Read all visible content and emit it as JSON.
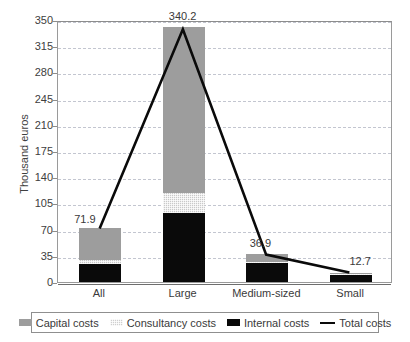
{
  "chart_data": {
    "type": "bar",
    "title": "",
    "subtitle": "",
    "xlabel": "",
    "ylabel": "Thousand euros",
    "ylim": [
      0,
      350
    ],
    "yticks": [
      0,
      35,
      70,
      105,
      140,
      175,
      210,
      245,
      280,
      315,
      350
    ],
    "grid": true,
    "legend_position": "bottom",
    "stacked": true,
    "categories": [
      "All",
      "Large",
      "Medium-sized",
      "Small"
    ],
    "series": [
      {
        "name": "Internal costs",
        "type": "bar",
        "color": "#0a0a0a",
        "values": [
          24.5,
          92.0,
          26.0,
          9.5
        ]
      },
      {
        "name": "Consultancy costs",
        "type": "bar",
        "color": "#c9c9c9",
        "values": [
          5.4,
          27.0,
          1.4,
          1.0
        ]
      },
      {
        "name": "Capital costs",
        "type": "bar",
        "color": "#9d9d9d",
        "values": [
          42.0,
          221.2,
          9.5,
          2.2
        ]
      },
      {
        "name": "Total costs",
        "type": "line",
        "color": "#0a0a0a",
        "values": [
          71.9,
          340.2,
          36.9,
          12.7
        ]
      }
    ],
    "data_labels": [
      "71.9",
      "340.2",
      "36.9",
      "12.7"
    ]
  },
  "axis": {
    "y_title": "Thousand euros",
    "y_ticks": [
      "350",
      "315",
      "280",
      "245",
      "210",
      "175",
      "140",
      "105",
      "70",
      "35",
      "0"
    ],
    "x_ticks": [
      "All",
      "Large",
      "Medium-sized",
      "Small"
    ]
  },
  "labels": {
    "all": "71.9",
    "large": "340.2",
    "medium": "36.9",
    "small": "12.7"
  },
  "legend": {
    "items": [
      {
        "label": "Capital costs",
        "swatch": "capital-swatch"
      },
      {
        "label": "Consultancy costs",
        "swatch": "consultancy-swatch"
      },
      {
        "label": "Internal costs",
        "swatch": "internal-swatch"
      },
      {
        "label": "Total costs",
        "swatch": "total-line-swatch"
      }
    ]
  },
  "colors": {
    "capital": "#9d9d9d",
    "consultancy": "#c9c9c9",
    "internal": "#0a0a0a",
    "total_line": "#0a0a0a",
    "grid": "#c3c6d0",
    "frame": "#9a9a9a"
  }
}
